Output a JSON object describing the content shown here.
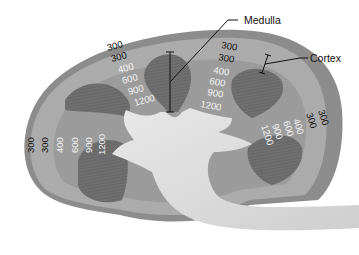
{
  "diagram": {
    "labels": {
      "medulla": "Medulla",
      "cortex": "Cortex"
    },
    "osmolarity_columns": [
      {
        "position": "top-left",
        "values": [
          "300",
          "300",
          "400",
          "600",
          "900",
          "1200"
        ]
      },
      {
        "position": "top-center",
        "values": [
          "300",
          "300",
          "400",
          "600",
          "900",
          "1200"
        ]
      },
      {
        "position": "left",
        "values": [
          "300",
          "300",
          "400",
          "600",
          "900",
          "1200"
        ]
      },
      {
        "position": "right",
        "values": [
          "300",
          "300",
          "400",
          "600",
          "900",
          "1200"
        ]
      }
    ],
    "colors": {
      "capsule": "#8a8a8a",
      "cortex": "#a9a9a9",
      "medulla_zone": "#9a9a9a",
      "pyramid": "#6e6e6e",
      "pelvis": "#dedede",
      "background": "#ffffff"
    }
  }
}
